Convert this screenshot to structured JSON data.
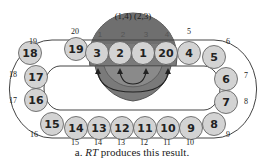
{
  "figure": {
    "swap_label": "(1,4) (2,3)",
    "slot_labels": [
      "1",
      "2",
      "3",
      "4"
    ],
    "caption_prefix": "a. ",
    "caption_italic": "RT",
    "caption_suffix": " produces this result.",
    "colors": {
      "node_fill": "#d3d3d3",
      "node_stroke": "#555555",
      "dome_fill": "#7a7a7a",
      "inner_dome_fill": "#8c8c8c",
      "track_stroke": "#444444"
    },
    "nodes": [
      {
        "label": "18",
        "cx": 30,
        "cy": 53
      },
      {
        "label": "19",
        "cx": 76,
        "cy": 49
      },
      {
        "label": "3",
        "cx": 97,
        "cy": 53
      },
      {
        "label": "2",
        "cx": 120,
        "cy": 53
      },
      {
        "label": "1",
        "cx": 143,
        "cy": 53
      },
      {
        "label": "20",
        "cx": 166,
        "cy": 53
      },
      {
        "label": "4",
        "cx": 189,
        "cy": 53
      },
      {
        "label": "5",
        "cx": 214,
        "cy": 57
      },
      {
        "label": "17",
        "cx": 36,
        "cy": 77
      },
      {
        "label": "16",
        "cx": 36,
        "cy": 100
      },
      {
        "label": "6",
        "cx": 226,
        "cy": 79
      },
      {
        "label": "7",
        "cx": 226,
        "cy": 102
      },
      {
        "label": "15",
        "cx": 52,
        "cy": 124
      },
      {
        "label": "14",
        "cx": 76,
        "cy": 128
      },
      {
        "label": "13",
        "cx": 99,
        "cy": 128
      },
      {
        "label": "12",
        "cx": 122,
        "cy": 128
      },
      {
        "label": "11",
        "cx": 145,
        "cy": 128
      },
      {
        "label": "10",
        "cx": 168,
        "cy": 128
      },
      {
        "label": "9",
        "cx": 191,
        "cy": 128
      },
      {
        "label": "8",
        "cx": 214,
        "cy": 124
      }
    ],
    "position_labels": [
      {
        "label": "20",
        "x": 75,
        "y": 34
      },
      {
        "label": "19",
        "x": 33,
        "y": 44
      },
      {
        "label": "18",
        "x": 13,
        "y": 77
      },
      {
        "label": "17",
        "x": 13,
        "y": 103
      },
      {
        "label": "16",
        "x": 34,
        "y": 137
      },
      {
        "label": "15",
        "x": 75,
        "y": 145
      },
      {
        "label": "14",
        "x": 98,
        "y": 145
      },
      {
        "label": "13",
        "x": 121,
        "y": 145
      },
      {
        "label": "12",
        "x": 144,
        "y": 145
      },
      {
        "label": "11",
        "x": 167,
        "y": 145
      },
      {
        "label": "10",
        "x": 190,
        "y": 145
      },
      {
        "label": "9",
        "x": 228,
        "y": 137
      },
      {
        "label": "8",
        "x": 246,
        "y": 104
      },
      {
        "label": "7",
        "x": 246,
        "y": 78
      },
      {
        "label": "6",
        "x": 228,
        "y": 44
      },
      {
        "label": "5",
        "x": 189,
        "y": 34
      }
    ]
  }
}
